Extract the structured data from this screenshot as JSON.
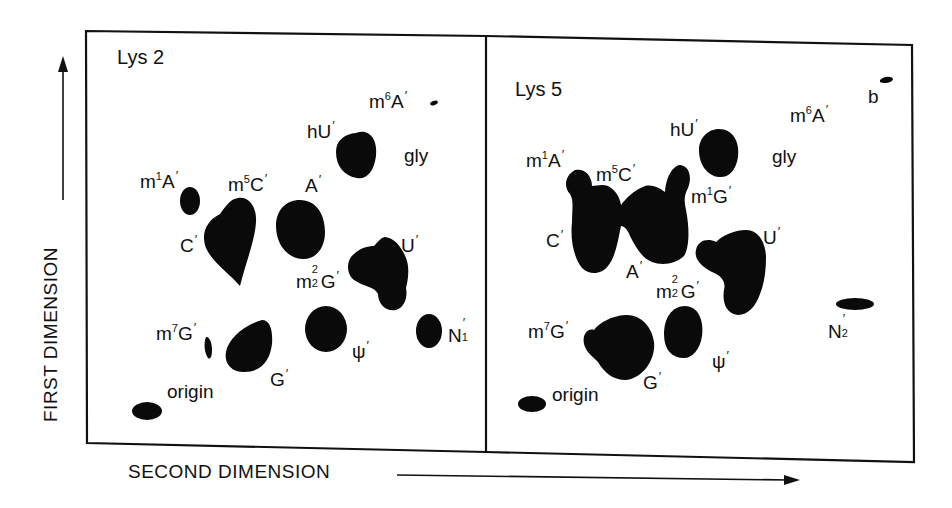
{
  "figure": {
    "axis_y_label": "FIRST DIMENSION",
    "axis_x_label": "SECOND DIMENSION",
    "ink_color": "#111111",
    "background": "#ffffff"
  },
  "panels": [
    {
      "title": "Lys 2",
      "labels": [
        {
          "id": "m6A",
          "base": "m",
          "sup": "6",
          "main": "A",
          "prime": "′"
        },
        {
          "id": "hU",
          "base": "hU",
          "prime": "′"
        },
        {
          "id": "gly",
          "base": "gly"
        },
        {
          "id": "m1A",
          "base": "m",
          "sup": "1",
          "main": "A",
          "prime": "′"
        },
        {
          "id": "m5C",
          "base": "m",
          "sup": "5",
          "main": "C",
          "prime": "′"
        },
        {
          "id": "A",
          "base": "A",
          "prime": "′"
        },
        {
          "id": "C",
          "base": "C",
          "prime": "′"
        },
        {
          "id": "U",
          "base": "U",
          "prime": "′"
        },
        {
          "id": "m22G",
          "base": "m",
          "sup": "2",
          "sub": "2",
          "main": "G",
          "prime": "′"
        },
        {
          "id": "m7G",
          "base": "m",
          "sup": "7",
          "main": "G",
          "prime": "′"
        },
        {
          "id": "N1",
          "base": "N",
          "sub": "1",
          "prime": "′"
        },
        {
          "id": "psi",
          "base": "ψ",
          "prime": "′"
        },
        {
          "id": "G",
          "base": "G",
          "prime": "′"
        },
        {
          "id": "origin",
          "base": "origin"
        }
      ]
    },
    {
      "title": "Lys 5",
      "labels": [
        {
          "id": "b",
          "base": "b"
        },
        {
          "id": "m6A",
          "base": "m",
          "sup": "6",
          "main": "A",
          "prime": "′"
        },
        {
          "id": "hU",
          "base": "hU",
          "prime": "′"
        },
        {
          "id": "gly",
          "base": "gly"
        },
        {
          "id": "m1A",
          "base": "m",
          "sup": "1",
          "main": "A",
          "prime": "′"
        },
        {
          "id": "m5C",
          "base": "m",
          "sup": "5",
          "main": "C",
          "prime": "′"
        },
        {
          "id": "m1G",
          "base": "m",
          "sup": "1",
          "main": "G",
          "prime": "′"
        },
        {
          "id": "C",
          "base": "C",
          "prime": "′"
        },
        {
          "id": "U",
          "base": "U",
          "prime": "′"
        },
        {
          "id": "A",
          "base": "A",
          "prime": "′"
        },
        {
          "id": "m22G",
          "base": "m",
          "sup": "2",
          "sub": "2",
          "main": "G",
          "prime": "′"
        },
        {
          "id": "N2",
          "base": "N",
          "sub": "2",
          "prime": "′"
        },
        {
          "id": "m7G",
          "base": "m",
          "sup": "7",
          "main": "G",
          "prime": "′"
        },
        {
          "id": "psi",
          "base": "ψ",
          "prime": "′"
        },
        {
          "id": "G",
          "base": "G",
          "prime": "′"
        },
        {
          "id": "origin",
          "base": "origin"
        }
      ]
    }
  ]
}
